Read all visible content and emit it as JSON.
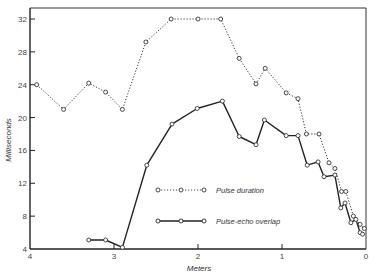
{
  "chart_data": {
    "type": "line",
    "title": "",
    "xlabel": "Meters",
    "ylabel": "Milliseconds",
    "xlim": [
      4,
      0
    ],
    "ylim": [
      4,
      33
    ],
    "x_reversed": true,
    "grid": false,
    "legend_position": "inside-center-right",
    "x_ticks": [
      4,
      3,
      2,
      1,
      0
    ],
    "y_ticks": [
      4,
      8,
      12,
      16,
      20,
      24,
      28,
      32
    ],
    "x_tick_labels": [
      "4",
      "3",
      "2",
      "1",
      "0"
    ],
    "y_tick_labels": [
      "4",
      "8",
      "12",
      "16",
      "20",
      "24",
      "28",
      "32"
    ],
    "series": [
      {
        "name": "Pulse duration",
        "style": "dotted",
        "marker": "open-circle",
        "color": "#333333",
        "x": [
          3.92,
          3.6,
          3.3,
          3.1,
          2.9,
          2.62,
          2.32,
          2.0,
          1.73,
          1.51,
          1.31,
          1.2,
          0.95,
          0.81,
          0.71,
          0.56,
          0.44,
          0.37,
          0.29,
          0.24,
          0.15,
          0.07,
          0.02
        ],
        "y": [
          24,
          21,
          24.2,
          23.1,
          21,
          29.2,
          32,
          32,
          32,
          27.2,
          24.1,
          26,
          23,
          22.3,
          18,
          18,
          14.5,
          13.8,
          11,
          11,
          8,
          7,
          6.5
        ]
      },
      {
        "name": "Pulse-echo overlap",
        "style": "solid",
        "marker": "open-circle",
        "color": "#222222",
        "x": [
          3.3,
          3.1,
          2.9,
          2.61,
          2.31,
          2.01,
          1.71,
          1.51,
          1.31,
          1.21,
          0.95,
          0.81,
          0.7,
          0.57,
          0.5,
          0.37,
          0.3,
          0.25,
          0.18,
          0.12,
          0.07,
          0.04
        ],
        "y": [
          5.1,
          5.1,
          4.2,
          14.2,
          19.2,
          21.1,
          22,
          17.7,
          16.7,
          19.7,
          17.8,
          17.8,
          14.2,
          14.6,
          12.8,
          13,
          9,
          9.6,
          7.2,
          7.6,
          6,
          5.8
        ]
      }
    ]
  },
  "legend": {
    "items": [
      {
        "label": "Pulse duration",
        "style": "dotted"
      },
      {
        "label": "Pulse-echo overlap",
        "style": "solid"
      }
    ]
  },
  "axes": {
    "x_title": "Meters",
    "y_title": "Milliseconds"
  }
}
